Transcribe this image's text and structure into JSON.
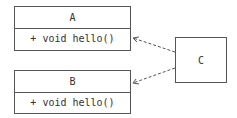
{
  "diagram": {
    "type": "uml-class",
    "classes": [
      {
        "id": "A",
        "name": "A",
        "operations": [
          "+ void hello()"
        ]
      },
      {
        "id": "B",
        "name": "B",
        "operations": [
          "+ void hello()"
        ]
      },
      {
        "id": "C",
        "name": "C",
        "operations": []
      }
    ],
    "relations": [
      {
        "from": "C",
        "to": "A",
        "style": "dashed",
        "arrow": "open"
      },
      {
        "from": "C",
        "to": "B",
        "style": "dashed",
        "arrow": "open"
      }
    ],
    "colors": {
      "stroke": "#555555",
      "text": "#333333",
      "background": "#ffffff"
    }
  }
}
